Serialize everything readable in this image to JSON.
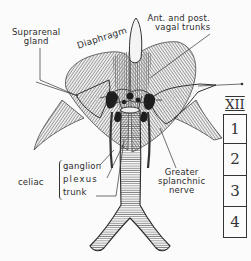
{
  "diagram": {
    "type": "anatomical-illustration",
    "labels": {
      "suprarenal_gland": [
        "Suprarenal",
        "gland"
      ],
      "vagal_trunks": [
        "Ant. and post.",
        "vagal trunks"
      ],
      "diaphragm": "Diaphragm",
      "celiac": "celiac",
      "celiac_parts": [
        "ganglion",
        "plexus",
        "trunk"
      ],
      "greater_splanchnic": [
        "Greater",
        "splanchnic",
        "nerve"
      ]
    },
    "vertebrae": {
      "thoracic": "XII",
      "lumbar": [
        "1",
        "2",
        "3",
        "4"
      ]
    },
    "colors": {
      "ink": "#2a2a2a",
      "paper": "#fbfbfb",
      "hatch": "#555555",
      "gland_fill": "#e9e9e9"
    }
  }
}
